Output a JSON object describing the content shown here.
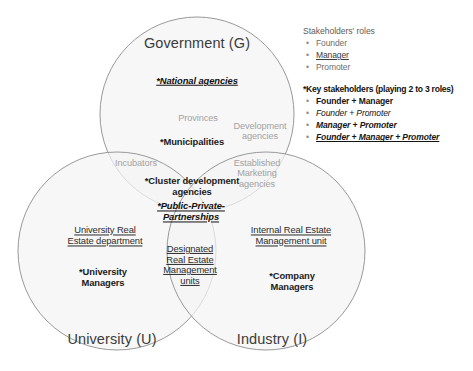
{
  "diagram": {
    "type": "venn-3-set",
    "circles": [
      {
        "key": "government",
        "label": "Government (G)",
        "cx": 197,
        "cy": 114,
        "r": 97,
        "label_x": 197,
        "label_y": 43
      },
      {
        "key": "university",
        "label": "University (U)",
        "cx": 117,
        "cy": 251,
        "r": 99,
        "label_x": 112,
        "label_y": 339
      },
      {
        "key": "industry",
        "label": "Industry (I)",
        "cx": 266,
        "cy": 251,
        "r": 99,
        "label_x": 272,
        "label_y": 339
      }
    ],
    "entries": [
      {
        "id": "national-agencies",
        "text": "*National agencies",
        "style": "key-ul",
        "x": 197,
        "y": 81,
        "region": "government"
      },
      {
        "id": "provinces",
        "text": "Provinces",
        "style": "faint",
        "x": 198,
        "y": 118,
        "region": "government"
      },
      {
        "id": "development-agencies",
        "text": "Development\nagencies",
        "style": "faint",
        "x": 260,
        "y": 131,
        "region": "government"
      },
      {
        "id": "municipalities",
        "text": "*Municipalities",
        "style": "key",
        "x": 192,
        "y": 142,
        "region": "government"
      },
      {
        "id": "incubators",
        "text": "Incubators",
        "style": "faint",
        "x": 136,
        "y": 163,
        "region": "government-university"
      },
      {
        "id": "established-marketing",
        "text": "Established\nMarketing\nagencies",
        "style": "faint",
        "x": 257,
        "y": 173,
        "region": "government-industry"
      },
      {
        "id": "cluster-development",
        "text": "*Cluster development\nagencies",
        "style": "key",
        "x": 192,
        "y": 187,
        "region": "center"
      },
      {
        "id": "public-private",
        "text": "*Public-Private-\nPartnerships",
        "style": "key-ul",
        "x": 191,
        "y": 212,
        "region": "center"
      },
      {
        "id": "university-real-estate",
        "text": "University Real\nEstate department",
        "style": "inst",
        "x": 105,
        "y": 236,
        "region": "university"
      },
      {
        "id": "designated-real-estate",
        "text": "Designated\nReal Estate\nManagement\nunits",
        "style": "inst",
        "x": 190,
        "y": 265,
        "region": "university-industry"
      },
      {
        "id": "internal-real-estate",
        "text": "Internal Real Estate\nManagement unit",
        "style": "inst",
        "x": 291,
        "y": 236,
        "region": "industry"
      },
      {
        "id": "university-managers",
        "text": "*University\nManagers",
        "style": "key",
        "x": 103,
        "y": 278,
        "region": "university"
      },
      {
        "id": "company-managers",
        "text": "*Company\nManagers",
        "style": "key",
        "x": 292,
        "y": 282,
        "region": "industry"
      }
    ]
  },
  "legend": {
    "roles_heading": "Stakeholders' roles",
    "roles": [
      {
        "label": "Founder",
        "style": "v-plain"
      },
      {
        "label": "Manager",
        "style": "v-underline"
      },
      {
        "label": "Promoter",
        "style": "v-plain"
      }
    ],
    "key_heading": "*Key stakeholders (playing 2 to 3 roles)",
    "key_items": [
      {
        "label": "Founder + Manager",
        "style": "v-bold"
      },
      {
        "label": "Founder + Promoter",
        "style": "v-italic"
      },
      {
        "label": "Manager + Promoter",
        "style": "v-bolditalic"
      },
      {
        "label": "Founder + Manager + Promoter",
        "style": "v-bolditalic-ul"
      }
    ],
    "bullet_glyph": "•"
  },
  "colors": {
    "circle_fill": "#f4f4f4",
    "circle_stroke": "#8d8d8d",
    "faint_text": "#a2a2a2",
    "key_text": "#1a1a1a",
    "background": "#ffffff"
  }
}
